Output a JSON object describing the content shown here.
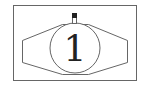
{
  "diagram": {
    "type": "watch-symbol",
    "marker_label": "1",
    "colors": {
      "stroke": "#555555",
      "knob_fill": "#222222",
      "background": "#ffffff"
    }
  }
}
